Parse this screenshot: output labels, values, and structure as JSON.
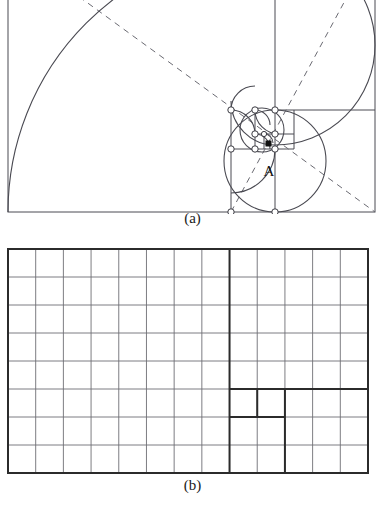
{
  "figure": {
    "panels": [
      {
        "id": "a",
        "caption": "(a)",
        "description": "golden-ratio rectangle with whirling squares, inscribed logarithmic spiral, dashed diagonals and circular vertex markers",
        "point_labels": [
          {
            "text": "A",
            "role": "spiral-pole"
          }
        ],
        "stroke_color": "#4a4a52",
        "marker_fill": "#ffffff",
        "pole_marker_fill": "#111111"
      },
      {
        "id": "b",
        "caption": "(b)",
        "description": "13 by 8 lattice of unit squares with heavy lines outlining the nested Fibonacci squares",
        "grid_columns": 13,
        "grid_rows": 8,
        "thin_color": "#6e6e74",
        "bold_color": "#2b2b2b"
      }
    ]
  },
  "chart_data": {
    "type": "diagram",
    "title": "",
    "panels": [
      {
        "label": "(a)",
        "type": "geometric-construction",
        "shape": "golden rectangle",
        "ratio": 1.618,
        "rect": {
          "x0": 8,
          "y0": -55,
          "x1": 375,
          "y1": 212,
          "width": 367,
          "height": 267
        },
        "squares": [
          {
            "index": 1,
            "size": 267,
            "x": 8,
            "y": -55
          },
          {
            "index": 2,
            "size": 165,
            "x": 275,
            "y": -55
          },
          {
            "index": 3,
            "size": 102,
            "x": 275,
            "y": 110
          },
          {
            "index": 4,
            "size": 63,
            "x": 231,
            "y": 149
          },
          {
            "index": 5,
            "size": 39,
            "x": 231,
            "y": 110
          },
          {
            "index": 6,
            "size": 24,
            "x": 255,
            "y": 110
          },
          {
            "index": 7,
            "size": 15,
            "x": 255,
            "y": 134
          },
          {
            "index": 8,
            "size": 9,
            "x": 264,
            "y": 134
          },
          {
            "index": 9,
            "size": 6,
            "x": 264,
            "y": 143
          }
        ],
        "spiral": "quarter-circle arcs inscribed in successive squares",
        "diagonals": 2,
        "diagonal_style": "dashed",
        "pole": {
          "label": "A",
          "x": 269,
          "y": 146
        },
        "markers": "open circles at whirling-square vertices, filled square at pole A"
      },
      {
        "label": "(b)",
        "type": "grid",
        "columns": 13,
        "rows": 8,
        "cell_size": 28,
        "rect": {
          "x0": 8,
          "y0": 249,
          "x1": 368,
          "y1": 473
        },
        "fibonacci_blocks": [
          {
            "size": 8,
            "note": "left 8x8 block bounded by heavy vertical line at column 8"
          },
          {
            "size": 5,
            "note": "right 5x5 block, columns 9-13 rows 1-5"
          },
          {
            "size": 3,
            "note": "3x3 block, columns 11-13 rows 6-8"
          },
          {
            "size": 2,
            "note": "2x2 block, columns 9-10 rows 7-8"
          },
          {
            "size": 1,
            "note": "unit square, column 9 row 6"
          },
          {
            "size": 1,
            "note": "unit square, column 10 row 6"
          }
        ],
        "bold_lines": [
          "vertical at x = 8 cells from left, full height",
          "horizontal at row 5 boundary, right portion",
          "vertical at column 10 boundary, rows 6",
          "horizontal at row 6 boundary, columns 9-10",
          "vertical at column 10 boundary rows 6-8"
        ]
      }
    ]
  }
}
